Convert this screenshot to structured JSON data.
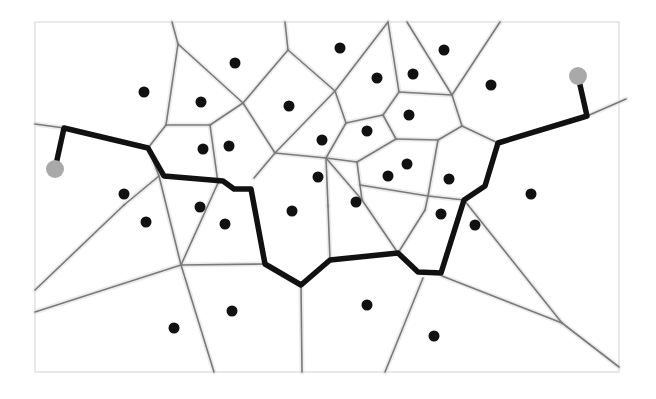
{
  "diagram": {
    "type": "voronoi-path",
    "colors": {
      "background": "#ffffff",
      "frame": "#e2e2e2",
      "voronoi_edge": "#7a7a7a",
      "path": "#111111",
      "site": "#111111",
      "endpoint": "#a9a9a9"
    },
    "frame": {
      "x": 35,
      "y": 22,
      "width": 584,
      "height": 350
    },
    "sites": [
      [
        144,
        92
      ],
      [
        235,
        63
      ],
      [
        201,
        102
      ],
      [
        203,
        149
      ],
      [
        229,
        146
      ],
      [
        289,
        106
      ],
      [
        340,
        48
      ],
      [
        377,
        78
      ],
      [
        413,
        74
      ],
      [
        444,
        50
      ],
      [
        491,
        85
      ],
      [
        322,
        140
      ],
      [
        367,
        131
      ],
      [
        409,
        115
      ],
      [
        407,
        164
      ],
      [
        388,
        176
      ],
      [
        318,
        177
      ],
      [
        356,
        202
      ],
      [
        292,
        211
      ],
      [
        124,
        194
      ],
      [
        146,
        222
      ],
      [
        200,
        207
      ],
      [
        225,
        224
      ],
      [
        449,
        179
      ],
      [
        441,
        214
      ],
      [
        475,
        225
      ],
      [
        531,
        194
      ],
      [
        232,
        311
      ],
      [
        174,
        328
      ],
      [
        367,
        305
      ],
      [
        434,
        336
      ]
    ],
    "endpoints": [
      {
        "name": "start",
        "x": 55,
        "y": 169,
        "r": 9
      },
      {
        "name": "goal",
        "x": 578,
        "y": 76,
        "r": 9
      }
    ],
    "edges": [
      [
        [
          172,
          22
        ],
        [
          178,
          44
        ]
      ],
      [
        [
          178,
          44
        ],
        [
          166,
          125
        ]
      ],
      [
        [
          178,
          44
        ],
        [
          243,
          103
        ]
      ],
      [
        [
          285,
          22
        ],
        [
          288,
          50
        ]
      ],
      [
        [
          288,
          50
        ],
        [
          243,
          103
        ]
      ],
      [
        [
          288,
          50
        ],
        [
          335,
          91
        ]
      ],
      [
        [
          35,
          124
        ],
        [
          64,
          128
        ]
      ],
      [
        [
          64,
          128
        ],
        [
          148,
          148
        ]
      ],
      [
        [
          148,
          148
        ],
        [
          166,
          125
        ]
      ],
      [
        [
          166,
          125
        ],
        [
          210,
          125
        ]
      ],
      [
        [
          210,
          125
        ],
        [
          243,
          103
        ]
      ],
      [
        [
          210,
          125
        ],
        [
          218,
          183
        ]
      ],
      [
        [
          243,
          103
        ],
        [
          275,
          153
        ]
      ],
      [
        [
          275,
          153
        ],
        [
          254,
          178
        ]
      ],
      [
        [
          275,
          153
        ],
        [
          335,
          91
        ]
      ],
      [
        [
          275,
          153
        ],
        [
          326,
          158
        ]
      ],
      [
        [
          335,
          91
        ],
        [
          388,
          22
        ]
      ],
      [
        [
          335,
          91
        ],
        [
          346,
          123
        ]
      ],
      [
        [
          346,
          123
        ],
        [
          326,
          158
        ]
      ],
      [
        [
          346,
          123
        ],
        [
          383,
          115
        ]
      ],
      [
        [
          388,
          22
        ],
        [
          399,
          92
        ]
      ],
      [
        [
          399,
          92
        ],
        [
          383,
          115
        ]
      ],
      [
        [
          399,
          92
        ],
        [
          452,
          95
        ]
      ],
      [
        [
          407,
          22
        ],
        [
          452,
          95
        ]
      ],
      [
        [
          452,
          95
        ],
        [
          500,
          22
        ]
      ],
      [
        [
          452,
          95
        ],
        [
          462,
          126
        ]
      ],
      [
        [
          383,
          115
        ],
        [
          396,
          139
        ]
      ],
      [
        [
          396,
          139
        ],
        [
          357,
          162
        ]
      ],
      [
        [
          396,
          139
        ],
        [
          438,
          140
        ]
      ],
      [
        [
          438,
          140
        ],
        [
          462,
          126
        ]
      ],
      [
        [
          438,
          140
        ],
        [
          428,
          196
        ]
      ],
      [
        [
          462,
          126
        ],
        [
          498,
          143
        ]
      ],
      [
        [
          326,
          158
        ],
        [
          357,
          162
        ]
      ],
      [
        [
          357,
          162
        ],
        [
          360,
          185
        ]
      ],
      [
        [
          326,
          158
        ],
        [
          328,
          206
        ]
      ],
      [
        [
          326,
          158
        ],
        [
          362,
          200
        ]
      ],
      [
        [
          360,
          185
        ],
        [
          428,
          196
        ]
      ],
      [
        [
          360,
          185
        ],
        [
          362,
          200
        ]
      ],
      [
        [
          328,
          206
        ],
        [
          330,
          260
        ]
      ],
      [
        [
          362,
          200
        ],
        [
          398,
          253
        ]
      ],
      [
        [
          428,
          196
        ],
        [
          464,
          200
        ]
      ],
      [
        [
          428,
          196
        ],
        [
          425,
          210
        ]
      ],
      [
        [
          398,
          253
        ],
        [
          425,
          210
        ]
      ],
      [
        [
          148,
          148
        ],
        [
          159,
          176
        ]
      ],
      [
        [
          159,
          176
        ],
        [
          124,
          205
        ]
      ],
      [
        [
          124,
          205
        ],
        [
          35,
          290
        ]
      ],
      [
        [
          159,
          176
        ],
        [
          181,
          265
        ]
      ],
      [
        [
          218,
          183
        ],
        [
          181,
          265
        ]
      ],
      [
        [
          181,
          265
        ],
        [
          265,
          264
        ]
      ],
      [
        [
          181,
          265
        ],
        [
          35,
          312
        ]
      ],
      [
        [
          181,
          265
        ],
        [
          214,
          372
        ]
      ],
      [
        [
          301,
          285
        ],
        [
          302,
          372
        ]
      ],
      [
        [
          423,
          278
        ],
        [
          385,
          372
        ]
      ],
      [
        [
          442,
          276
        ],
        [
          562,
          323
        ]
      ],
      [
        [
          464,
          200
        ],
        [
          562,
          323
        ]
      ],
      [
        [
          562,
          323
        ],
        [
          619,
          367
        ]
      ],
      [
        [
          587,
          116
        ],
        [
          626,
          99
        ]
      ]
    ],
    "path": [
      [
        55,
        169
      ],
      [
        64,
        128
      ],
      [
        148,
        148
      ],
      [
        164,
        176
      ],
      [
        223,
        181
      ],
      [
        234,
        189
      ],
      [
        251,
        189
      ],
      [
        265,
        264
      ],
      [
        301,
        285
      ],
      [
        330,
        260
      ],
      [
        398,
        253
      ],
      [
        418,
        272
      ],
      [
        441,
        273
      ],
      [
        464,
        200
      ],
      [
        485,
        186
      ],
      [
        498,
        143
      ],
      [
        587,
        116
      ],
      [
        578,
        76
      ]
    ]
  }
}
